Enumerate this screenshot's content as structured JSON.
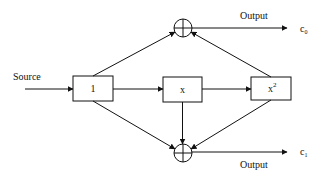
{
  "diagram": {
    "type": "block-diagram",
    "input": {
      "label": "Source"
    },
    "blocks": [
      {
        "id": "b1",
        "label": "1"
      },
      {
        "id": "bx",
        "label": "x"
      },
      {
        "id": "bx2",
        "label": "x",
        "superscript": "2"
      }
    ],
    "summers": [
      {
        "id": "sum_top",
        "symbol": "⊕"
      },
      {
        "id": "sum_bottom",
        "symbol": "⊕"
      }
    ],
    "outputs": [
      {
        "label": "Output",
        "var": "c",
        "sub": "0"
      },
      {
        "label": "Output",
        "var": "c",
        "sub": "1"
      }
    ],
    "edges": [
      [
        "Source",
        "b1"
      ],
      [
        "b1",
        "bx"
      ],
      [
        "bx",
        "bx2"
      ],
      [
        "b1",
        "sum_top"
      ],
      [
        "bx2",
        "sum_top"
      ],
      [
        "b1",
        "sum_bottom"
      ],
      [
        "bx",
        "sum_bottom"
      ],
      [
        "bx2",
        "sum_bottom"
      ],
      [
        "sum_top",
        "c0"
      ],
      [
        "sum_bottom",
        "c1"
      ]
    ]
  }
}
